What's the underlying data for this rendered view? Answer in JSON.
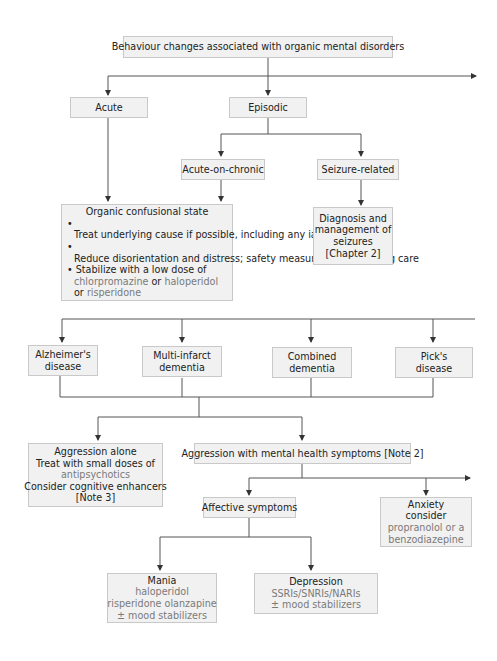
{
  "diagram": {
    "root": {
      "label": "Behaviour changes associated with organic mental disorders"
    },
    "level1": {
      "acute": {
        "label": "Acute"
      },
      "episodic": {
        "label": "Episodic"
      }
    },
    "episodic_children": {
      "acute_on_chronic": {
        "label": "Acute-on-chronic"
      },
      "seizure_related": {
        "label": "Seizure-related"
      }
    },
    "organic_confusional_state": {
      "title": "Organic confusional state",
      "bullets": [
        "Treat underlying cause if possible, including any iatrogenic causes",
        "Reduce disorientation and distress; safety measures; good nursing care"
      ],
      "bullet3_prefix": "Stabilize with a low dose of",
      "drug1": "chlorpromazine",
      "or1": "or",
      "drug2": "haloperidol",
      "or2": "or",
      "drug3": "risperidone",
      "bullet_char": "•"
    },
    "seizures": {
      "lines": [
        "Diagnosis and",
        "management of",
        "seizures",
        "[Chapter 2]"
      ]
    },
    "dementias": [
      {
        "line1": "Alzheimer's",
        "line2": "disease"
      },
      {
        "line1": "Multi-infarct",
        "line2": "dementia"
      },
      {
        "line1": "Combined",
        "line2": "dementia"
      },
      {
        "line1": "Pick's",
        "line2": "disease"
      }
    ],
    "aggression_alone": {
      "line1": "Aggression alone",
      "line2": "Treat with small doses of",
      "drug": "antipsychotics",
      "line4": "Consider cognitive enhancers",
      "line5": "[Note 3]"
    },
    "aggression_mh": {
      "label": "Aggression with mental health symptoms [Note 2]"
    },
    "affective": {
      "label": "Affective symptoms"
    },
    "anxiety": {
      "line1": "Anxiety",
      "line2": "consider",
      "drug1": "propranolol or a",
      "drug2": "benzodiazepine"
    },
    "mania": {
      "title": "Mania",
      "drug1": "haloperidol",
      "drug2": "risperidone olanzapine",
      "drug3": "± mood stabilizers"
    },
    "depression": {
      "title": "Depression",
      "drug1": "SSRIs/SNRIs/NARIs",
      "drug2": "± mood stabilizers"
    }
  },
  "colors": {
    "box_fill": "#f1f1f1",
    "box_border": "#c9c9c9",
    "line": "#555555",
    "drug_text": "#7a7a7a"
  }
}
